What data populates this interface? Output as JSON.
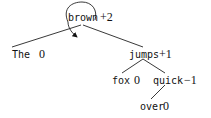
{
  "diagram": {
    "type": "dependency-tree",
    "nodes": [
      {
        "id": "brown",
        "word": "brown",
        "score": "+2",
        "root": true
      },
      {
        "id": "the",
        "word": "The",
        "score": "0"
      },
      {
        "id": "jumps",
        "word": "jumps",
        "score": "+1"
      },
      {
        "id": "fox",
        "word": "fox",
        "score": "0"
      },
      {
        "id": "quick",
        "word": "quick",
        "score": "−1"
      },
      {
        "id": "over",
        "word": "over",
        "score": "0"
      }
    ],
    "edges": [
      {
        "from": "brown",
        "to": "the"
      },
      {
        "from": "brown",
        "to": "jumps"
      },
      {
        "from": "jumps",
        "to": "fox"
      },
      {
        "from": "jumps",
        "to": "quick"
      },
      {
        "from": "quick",
        "to": "over"
      }
    ],
    "self_loop": {
      "node": "brown",
      "arrow": true
    }
  }
}
